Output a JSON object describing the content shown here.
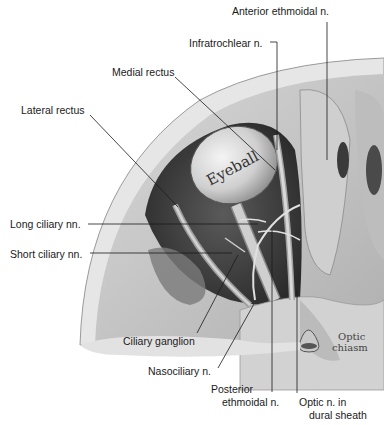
{
  "figure": {
    "embedded_labels": {
      "eyeball": "Eyeball",
      "optic_chiasm_line1": "Optic",
      "optic_chiasm_line2": "chiasm"
    },
    "labels": [
      {
        "id": "anterior-ethmoidal",
        "text": "Anterior ethmoidal n."
      },
      {
        "id": "infratrochlear",
        "text": "Infratrochlear n."
      },
      {
        "id": "medial-rectus",
        "text": "Medial rectus"
      },
      {
        "id": "lateral-rectus",
        "text": "Lateral rectus"
      },
      {
        "id": "long-ciliary",
        "text": "Long ciliary nn."
      },
      {
        "id": "short-ciliary",
        "text": "Short ciliary nn."
      },
      {
        "id": "ciliary-ganglion",
        "text": "Ciliary ganglion"
      },
      {
        "id": "nasociliary",
        "text": "Nasociliary n."
      },
      {
        "id": "posterior-ethmoidal-1",
        "text": "Posterior"
      },
      {
        "id": "posterior-ethmoidal-2",
        "text": "ethmoidal n."
      },
      {
        "id": "optic-sheath-1",
        "text": "Optic n. in"
      },
      {
        "id": "optic-sheath-2",
        "text": "dural sheath"
      }
    ]
  },
  "colors": {
    "bone_light": "#e4e4e4",
    "bone_mid": "#bdbdbd",
    "cavity_dark": "#3a3a3a",
    "eyeball": "#d9d9d9",
    "leader_line": "#1a1a1a",
    "text": "#1a1a1a"
  }
}
